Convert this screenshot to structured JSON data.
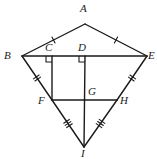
{
  "figure": {
    "stroke_color": "#1a1a1a",
    "background_color": "#ffffff",
    "width": 157,
    "height": 159
  },
  "points": {
    "A": {
      "label": "A",
      "x": 85,
      "y": 24,
      "label_x": 80,
      "label_y": 3
    },
    "B": {
      "label": "B",
      "x": 22,
      "y": 56,
      "label_x": 4,
      "label_y": 50
    },
    "C": {
      "label": "C",
      "x": 52,
      "y": 56,
      "label_x": 45,
      "label_y": 42
    },
    "D": {
      "label": "D",
      "x": 85,
      "y": 56,
      "label_x": 78,
      "label_y": 42
    },
    "E": {
      "label": "E",
      "x": 147,
      "y": 56,
      "label_x": 148,
      "label_y": 50
    },
    "F": {
      "label": "F",
      "x": 52,
      "y": 100,
      "label_x": 38,
      "label_y": 95
    },
    "G": {
      "label": "G",
      "x": 85,
      "y": 100,
      "label_x": 88,
      "label_y": 86
    },
    "H": {
      "label": "H",
      "x": 117,
      "y": 100,
      "label_x": 120,
      "label_y": 95
    },
    "I": {
      "label": "I",
      "x": 84,
      "y": 147,
      "label_x": 81,
      "label_y": 148
    }
  },
  "segments": [
    {
      "name": "AB",
      "from": "A",
      "to": "B",
      "ticks": 1
    },
    {
      "name": "AE",
      "from": "A",
      "to": "E",
      "ticks": 1
    },
    {
      "name": "BE",
      "from": "B",
      "to": "E",
      "ticks": 0
    },
    {
      "name": "BF",
      "from": "B",
      "to": "F",
      "ticks": 2
    },
    {
      "name": "FI",
      "from": "F",
      "to": "I",
      "ticks": 3
    },
    {
      "name": "EH",
      "from": "E",
      "to": "H",
      "ticks": 2
    },
    {
      "name": "HI",
      "from": "H",
      "to": "I",
      "ticks": 3
    },
    {
      "name": "FH",
      "from": "F",
      "to": "H",
      "ticks": 0
    },
    {
      "name": "CF",
      "from": "C",
      "to": "F",
      "ticks": 0
    },
    {
      "name": "DI",
      "from": "D",
      "to": "I",
      "ticks": 0
    }
  ],
  "right_angles": [
    {
      "name": "angle-at-C",
      "vertex": "C",
      "x": 52,
      "y": 56,
      "dir_x": -1,
      "dir_y": 1
    },
    {
      "name": "angle-at-D",
      "vertex": "D",
      "x": 85,
      "y": 56,
      "dir_x": -1,
      "dir_y": 1
    }
  ]
}
